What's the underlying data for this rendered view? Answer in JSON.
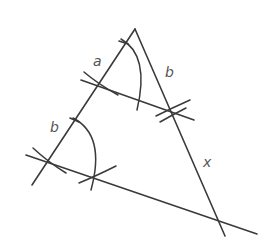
{
  "diagram": {
    "colors": {
      "stroke": "#3a3a3a",
      "label": "#555555",
      "background": "#ffffff"
    },
    "labels": [
      {
        "id": "a",
        "text": "a",
        "x": 93,
        "y": 66
      },
      {
        "id": "b-top",
        "text": "b",
        "x": 165,
        "y": 77
      },
      {
        "id": "b-left",
        "text": "b",
        "x": 50,
        "y": 132
      },
      {
        "id": "x",
        "text": "x",
        "x": 203,
        "y": 167
      }
    ]
  }
}
